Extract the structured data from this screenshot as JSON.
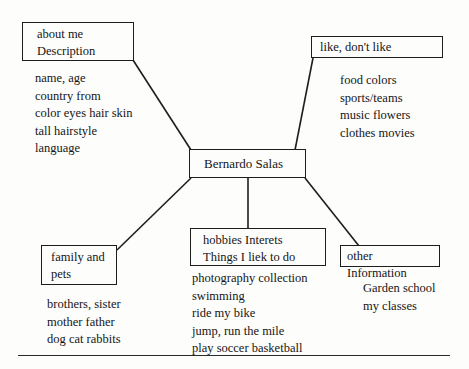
{
  "diagram": {
    "type": "concept-map",
    "title": "Bernardo Salas",
    "center": {
      "label": "Bernardo Salas"
    },
    "branches": [
      {
        "id": "about-me",
        "heading_lines": [
          "about me",
          "Description"
        ],
        "details": [
          "name, age",
          "country  from",
          "color eyes hair skin",
          "tall hairstyle",
          "language"
        ]
      },
      {
        "id": "likes",
        "heading_lines": [
          "like, don't like"
        ],
        "details": [
          "food colors",
          "sports/teams",
          "music flowers",
          "clothes movies"
        ]
      },
      {
        "id": "family-and-pets",
        "heading_lines": [
          "family and",
          "pets"
        ],
        "details": [
          "brothers, sister",
          "mother father",
          "dog cat rabbits"
        ]
      },
      {
        "id": "hobbies",
        "heading_lines": [
          "hobbies Interets",
          "Things I liek to do"
        ],
        "details": [
          "photography collection",
          "swimming",
          "ride my bike",
          "jump, run the mile",
          "play soccer basketball"
        ]
      },
      {
        "id": "other-information",
        "heading_lines": [
          "other Information"
        ],
        "details": [
          "Garden school",
          "my classes"
        ]
      }
    ],
    "colors": {
      "ink": "#1d1d1d",
      "paper": "#fdfdfc",
      "rule": "#2a2a2a"
    }
  }
}
